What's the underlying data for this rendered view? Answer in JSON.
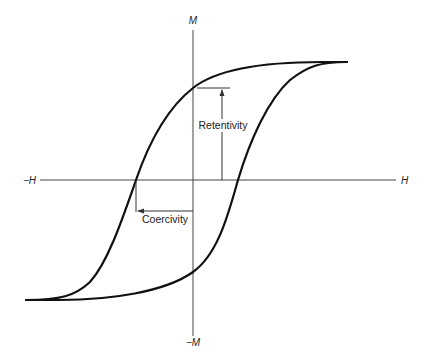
{
  "diagram": {
    "type": "hysteresis-loop",
    "axes": {
      "y_positive": "M",
      "y_negative": "−M",
      "x_positive": "H",
      "x_negative": "−H"
    },
    "annotations": {
      "retentivity": "Retentivity",
      "coercivity": "Coercivity"
    },
    "colors": {
      "curve": "#111111",
      "axis": "#444444",
      "background": "#ffffff"
    }
  }
}
